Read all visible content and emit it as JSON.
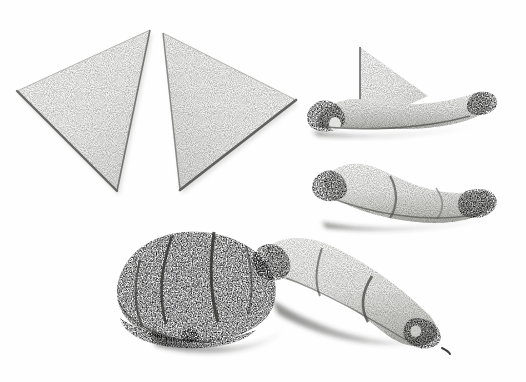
{
  "figure": {
    "medium": "stipple engraving",
    "background_color": "#fefefe",
    "ink_color": "#2b2b2b",
    "width": 526,
    "height": 382,
    "caption": "",
    "rule": {
      "label": "top-rule",
      "y": 11,
      "color": "#8e8e8e"
    }
  },
  "objects": [
    {
      "id": "triangle-left",
      "label": "Cut dough triangle, left",
      "stage": 1,
      "description": "Flat raw laminated-dough triangle lying on the surface, apex pointing up-right",
      "position": {
        "x": 14,
        "y": 28,
        "width": 150,
        "height": 165
      },
      "tone": "very light",
      "has_shadow": true
    },
    {
      "id": "triangle-right",
      "label": "Cut dough triangle, right",
      "stage": 1,
      "description": "Second flat raw dough triangle, mirrored, apex pointing up-left",
      "position": {
        "x": 160,
        "y": 28,
        "width": 140,
        "height": 165
      },
      "tone": "very light",
      "has_shadow": true
    },
    {
      "id": "roll-start",
      "label": "First roll",
      "stage": 2,
      "description": "Dough triangle rolled once from the wide base; the pointed tip still stands upright behind the roll",
      "position": {
        "x": 300,
        "y": 45,
        "width": 205,
        "height": 100
      },
      "tone": "light with dark hollow ends",
      "has_shadow": true
    },
    {
      "id": "roll-mid",
      "label": "Second roll",
      "stage": 3,
      "description": "Dough rolled further into a tapering tube; both open ends show dark hollows",
      "position": {
        "x": 305,
        "y": 148,
        "width": 210,
        "height": 95
      },
      "tone": "light with dark hollow ends",
      "has_shadow": true
    },
    {
      "id": "shaped-raw",
      "label": "Shaped raw croissant",
      "stage": 4,
      "description": "Fully rolled unbaked croissant, crescent-tapered, dark hollow at the tucked tip",
      "position": {
        "x": 258,
        "y": 228,
        "width": 205,
        "height": 120
      },
      "tone": "light, soft",
      "has_shadow": true
    },
    {
      "id": "baked",
      "label": "Baked croissant",
      "stage": 5,
      "description": "Finished baked croissant with dark crust, visible roll ridges and cast shadow",
      "position": {
        "x": 52,
        "y": 228,
        "width": 225,
        "height": 125
      },
      "tone": "dark, heavily stippled",
      "has_shadow": true
    }
  ]
}
